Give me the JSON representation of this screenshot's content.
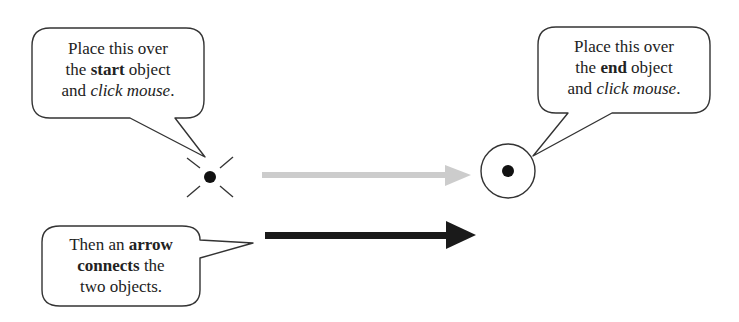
{
  "diagram": {
    "start_bubble": {
      "lines": [
        [
          {
            "t": "Place this over",
            "s": "normal"
          }
        ],
        [
          {
            "t": "the ",
            "s": "normal"
          },
          {
            "t": "start",
            "s": "bold"
          },
          {
            "t": " object",
            "s": "normal"
          }
        ],
        [
          {
            "t": "and ",
            "s": "normal"
          },
          {
            "t": "click mouse",
            "s": "italic"
          },
          {
            "t": ".",
            "s": "normal"
          }
        ]
      ]
    },
    "end_bubble": {
      "lines": [
        [
          {
            "t": "Place this over",
            "s": "normal"
          }
        ],
        [
          {
            "t": "the ",
            "s": "normal"
          },
          {
            "t": "end",
            "s": "bold"
          },
          {
            "t": " object",
            "s": "normal"
          }
        ],
        [
          {
            "t": "and ",
            "s": "normal"
          },
          {
            "t": "click mouse",
            "s": "italic"
          },
          {
            "t": ".",
            "s": "normal"
          }
        ]
      ]
    },
    "result_bubble": {
      "lines": [
        [
          {
            "t": "Then an ",
            "s": "normal"
          },
          {
            "t": "arrow",
            "s": "bold"
          }
        ],
        [
          {
            "t": "connects",
            "s": "bold"
          },
          {
            "t": " the",
            "s": "normal"
          }
        ],
        [
          {
            "t": "two objects.",
            "s": "normal"
          }
        ]
      ]
    },
    "icons": {
      "start_cursor": "crosshair-dot-icon",
      "end_cursor": "circle-dot-icon",
      "preview_arrow": "gray-arrow-icon",
      "final_arrow": "black-arrow-icon"
    },
    "colors": {
      "stroke": "#333333",
      "preview_arrow": "#cccccc",
      "final_arrow": "#1a1a1a"
    }
  }
}
